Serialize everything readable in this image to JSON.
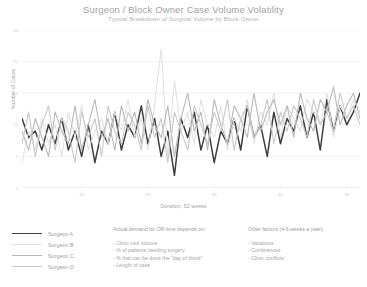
{
  "header": {
    "title": "Surgeon / Block Owner Case Volume Volatility",
    "subtitle": "Typical Breakdown of Surgical Volume by Block Owner"
  },
  "legend": {
    "items": [
      {
        "label": "Surgeon A",
        "color": "#3f3f3f",
        "width": 1.5
      },
      {
        "label": "Surgeon B",
        "color": "#e2e2e2",
        "width": 1.1
      },
      {
        "label": "Surgeon C",
        "color": "#b9b9b9",
        "width": 1.1
      },
      {
        "label": "Surgeon D",
        "color": "#c9c9c9",
        "width": 1.1
      }
    ]
  },
  "notes": {
    "left": {
      "head": "Actual demand for OR time depends on:",
      "items": [
        "- Clinic visit volume",
        "- % of patients needing surgery",
        "- % that can be done the \"day of block\"",
        "- Length of case"
      ]
    },
    "right": {
      "head": "Other factors (4-6 weeks a year):",
      "items": [
        "- Vacations",
        "- Conferences",
        "- Clinic conflicts"
      ]
    }
  },
  "chart_data": {
    "type": "line",
    "title": "Surgeon / Block Owner Case Volume Volatility",
    "subtitle": "Typical Breakdown of Surgical Volume by Block Owner",
    "xlabel": "Duration, 52 weeks",
    "ylabel": "Number of Cases",
    "grid": true,
    "legend_position": "bottom-left",
    "xlim": [
      1,
      52
    ],
    "ylim": [
      0,
      25
    ],
    "yticks": [
      0,
      5,
      10,
      15,
      20,
      25
    ],
    "ytick_labels": [
      "0",
      "5",
      "10",
      "15",
      "20",
      "25"
    ],
    "xticks": [
      10,
      20,
      30,
      40,
      50
    ],
    "xtick_labels": [
      "10",
      "20",
      "30",
      "40",
      "50"
    ],
    "x": [
      1,
      2,
      3,
      4,
      5,
      6,
      7,
      8,
      9,
      10,
      11,
      12,
      13,
      14,
      15,
      16,
      17,
      18,
      19,
      20,
      21,
      22,
      23,
      24,
      25,
      26,
      27,
      28,
      29,
      30,
      31,
      32,
      33,
      34,
      35,
      36,
      37,
      38,
      39,
      40,
      41,
      42,
      43,
      44,
      45,
      46,
      47,
      48,
      49,
      50,
      51,
      52
    ],
    "series": [
      {
        "name": "Surgeon A",
        "color": "#3f3f3f",
        "width": 1.5,
        "values": [
          11,
          8,
          9,
          6,
          10,
          7,
          11,
          6,
          9,
          5,
          10,
          4,
          9,
          7,
          12,
          6,
          10,
          8,
          13,
          7,
          11,
          5,
          9,
          2,
          11,
          8,
          12,
          6,
          10,
          4,
          9,
          7,
          11,
          6,
          13,
          8,
          10,
          5,
          12,
          7,
          11,
          9,
          13,
          8,
          12,
          6,
          14,
          9,
          13,
          10,
          12,
          15
        ]
      },
      {
        "name": "Surgeon B",
        "color": "#e2e2e2",
        "width": 1.1,
        "values": [
          4,
          9,
          6,
          11,
          7,
          10,
          5,
          12,
          8,
          13,
          6,
          9,
          11,
          7,
          12,
          9,
          14,
          8,
          11,
          6,
          13,
          22,
          5,
          17,
          9,
          12,
          7,
          14,
          10,
          8,
          13,
          6,
          11,
          9,
          14,
          7,
          12,
          10,
          15,
          8,
          13,
          11,
          9,
          14,
          12,
          10,
          15,
          8,
          13,
          11,
          14,
          12
        ]
      },
      {
        "name": "Surgeon C",
        "color": "#b9b9b9",
        "width": 1.1,
        "values": [
          9,
          6,
          11,
          8,
          5,
          12,
          9,
          7,
          13,
          6,
          10,
          14,
          8,
          11,
          6,
          13,
          9,
          12,
          7,
          14,
          10,
          8,
          13,
          5,
          11,
          15,
          9,
          12,
          6,
          14,
          10,
          7,
          13,
          11,
          8,
          15,
          9,
          12,
          14,
          10,
          13,
          8,
          15,
          11,
          9,
          14,
          12,
          16,
          10,
          13,
          15,
          11
        ]
      },
      {
        "name": "Surgeon D",
        "color": "#c9c9c9",
        "width": 1.1,
        "values": [
          7,
          12,
          5,
          10,
          13,
          6,
          11,
          9,
          4,
          12,
          8,
          11,
          5,
          13,
          9,
          7,
          12,
          10,
          6,
          13,
          8,
          11,
          4,
          12,
          9,
          6,
          13,
          10,
          7,
          12,
          9,
          14,
          6,
          11,
          13,
          8,
          10,
          14,
          7,
          12,
          9,
          13,
          11,
          8,
          14,
          10,
          12,
          9,
          15,
          11,
          13,
          10
        ]
      }
    ]
  }
}
